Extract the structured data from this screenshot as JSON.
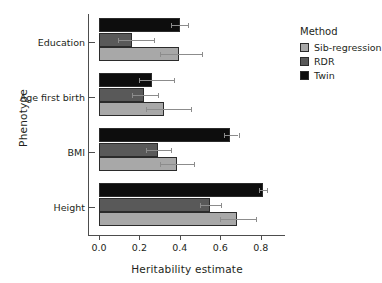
{
  "chart_data": {
    "type": "bar",
    "orientation": "horizontal",
    "title": "",
    "xlabel": "Heritability estimate",
    "ylabel": "Phenotype",
    "categories": [
      "Education",
      "Age first birth",
      "BMI",
      "Height"
    ],
    "xlim": [
      0.0,
      0.92
    ],
    "xticks": [
      "0.0",
      "0.2",
      "0.4",
      "0.6",
      "0.8"
    ],
    "xtick_values": [
      0.0,
      0.2,
      0.4,
      0.6,
      0.8
    ],
    "grid": false,
    "legend_title": "Method",
    "legend_position": "right",
    "series": [
      {
        "name": "Sib-regression",
        "color": "#a8a8a8",
        "values": [
          0.395,
          0.32,
          0.385,
          0.685
        ],
        "err_low": [
          0.3,
          0.23,
          0.3,
          0.6
        ],
        "err_high": [
          0.51,
          0.455,
          0.47,
          0.775
        ]
      },
      {
        "name": "RDR",
        "color": "#595959",
        "values": [
          0.165,
          0.225,
          0.29,
          0.55
        ],
        "err_low": [
          0.095,
          0.165,
          0.23,
          0.5
        ],
        "err_high": [
          0.27,
          0.29,
          0.355,
          0.605
        ]
      },
      {
        "name": "Twin",
        "color": "#0d0d0d",
        "values": [
          0.4,
          0.26,
          0.65,
          0.81
        ],
        "err_low": [
          0.355,
          0.2,
          0.62,
          0.79
        ],
        "err_high": [
          0.44,
          0.37,
          0.69,
          0.83
        ]
      }
    ]
  },
  "legend": {
    "title": "Method",
    "items": [
      {
        "label": "Sib-regression"
      },
      {
        "label": "RDR"
      },
      {
        "label": "Twin"
      }
    ]
  },
  "axes": {
    "x_title": "Heritability estimate",
    "y_title": "Phenotype"
  }
}
